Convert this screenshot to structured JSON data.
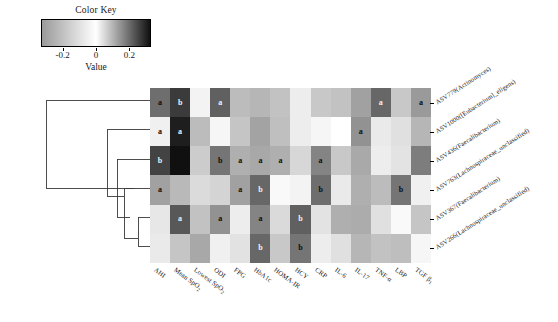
{
  "color_key": {
    "title": "Color Key",
    "axis_label": "Value",
    "ticks": [
      {
        "label": "-0.2",
        "value": -0.2
      },
      {
        "label": "0",
        "value": 0
      },
      {
        "label": "0.2",
        "value": 0.2
      }
    ],
    "vmin": -0.33,
    "vmax": 0.33,
    "low_color": "#9a9a9a",
    "mid_color": "#ffffff",
    "high_color": "#101010"
  },
  "chart_data": {
    "type": "heatmap",
    "title": "Color Key",
    "xlabel": "",
    "ylabel": "",
    "colorbar_label": "Value",
    "colorbar_range": [
      -0.33,
      0.33
    ],
    "colorbar_ticks": [
      -0.2,
      0,
      0.2
    ],
    "colormap": "grayscale (light = negative, dark = positive)",
    "grid": false,
    "legend": "none",
    "row_dendrogram": true,
    "column_dendrogram": false,
    "x_categories": [
      "AHI",
      "Mean SpO2",
      "Lowest SpO2",
      "ODI",
      "FPG",
      "HbA1c",
      "HOMA-IR",
      "HCY",
      "CRP",
      "IL-6",
      "IL-17",
      "TNF-a",
      "LBP",
      "TGF B1"
    ],
    "y_categories": [
      "ASV779(Actinomyces)",
      "ASV1000([Eubacterium]_eligens)",
      "ASV436(Faecalibacterium)",
      "ASV763(Lachnospiraceae_unclassified)",
      "ASV367(Faecalibacterium)",
      "ASV266(Lachnospiraceae_unclassified)"
    ],
    "significance_codes": {
      "a": "P < 0.05",
      "b": "P < 0.01"
    },
    "values": [
      [
        0.2,
        0.27,
        -0.04,
        0.22,
        -0.22,
        -0.24,
        -0.2,
        -0.06,
        -0.18,
        -0.2,
        0.13,
        0.21,
        -0.18,
        0.14
      ],
      [
        -0.05,
        0.31,
        -0.22,
        -0.03,
        -0.19,
        -0.3,
        -0.21,
        -0.06,
        -0.03,
        0.0,
        0.15,
        -0.07,
        -0.1,
        -0.24
      ],
      [
        0.26,
        0.33,
        0.07,
        0.19,
        0.11,
        0.12,
        0.11,
        -0.13,
        0.17,
        -0.18,
        -0.28,
        -0.06,
        -0.09,
        0.18
      ],
      [
        0.13,
        -0.23,
        0.05,
        -0.14,
        0.13,
        0.21,
        -0.02,
        -0.04,
        0.2,
        -0.07,
        -0.26,
        -0.22,
        0.19,
        -0.05
      ],
      [
        -0.08,
        0.23,
        -0.2,
        0.15,
        -0.06,
        0.17,
        -0.12,
        0.22,
        -0.09,
        -0.26,
        -0.27,
        -0.1,
        -0.02,
        -0.19
      ],
      [
        -0.07,
        0.08,
        0.12,
        -0.05,
        0.04,
        0.21,
        -0.18,
        0.19,
        -0.06,
        -0.1,
        -0.24,
        -0.2,
        0.09,
        -0.03
      ]
    ],
    "annotations": [
      [
        "a",
        "b",
        "",
        "a",
        "",
        "",
        "",
        "",
        "",
        "",
        "",
        "a",
        "",
        "a"
      ],
      [
        "a",
        "a",
        "",
        "",
        "",
        "",
        "",
        "",
        "",
        "",
        "a",
        "",
        "",
        ""
      ],
      [
        "b",
        "",
        "",
        "b",
        "a",
        "a",
        "a",
        "",
        "a",
        "",
        "",
        "",
        "",
        ""
      ],
      [
        "a",
        "",
        "",
        "",
        "a",
        "b",
        "",
        "",
        "b",
        "",
        "",
        "",
        "b",
        ""
      ],
      [
        "",
        "a",
        "",
        "a",
        "",
        "a",
        "",
        "b",
        "",
        "",
        "",
        "",
        "",
        ""
      ],
      [
        "",
        "",
        "",
        "",
        "",
        "b",
        "",
        "b",
        "",
        "",
        "",
        "",
        "",
        ""
      ]
    ]
  },
  "dendrogram": {
    "description": "row clustering tree, ladder topology",
    "leaf_order": [
      0,
      1,
      2,
      3,
      4,
      5
    ]
  }
}
